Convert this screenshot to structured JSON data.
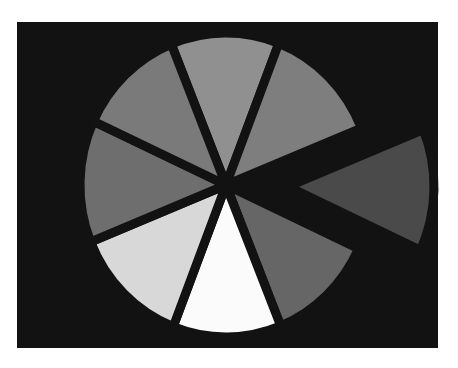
{
  "chart_data": {
    "type": "pie",
    "title": "",
    "background": "#121212",
    "center": [
      226,
      185
    ],
    "radius": [
      146,
      152
    ],
    "gap_width": 9,
    "start_angle_deg": -22,
    "exploded_index": 2,
    "explode_offset": 62,
    "categories": [
      "Slice 1",
      "Slice 2",
      "Slice 3",
      "Slice 4",
      "Slice 5",
      "Slice 6",
      "Slice 7",
      "Slice 8"
    ],
    "values": [
      12,
      13,
      13,
      12,
      12,
      13,
      13,
      12
    ],
    "colors": [
      "#909090",
      "#7e7e7e",
      "#4a4a4a",
      "#666666",
      "#fbfbfb",
      "#d8d8d8",
      "#6e6e6e",
      "#7a7a7a"
    ],
    "legend": "none",
    "labels_visible": false
  }
}
